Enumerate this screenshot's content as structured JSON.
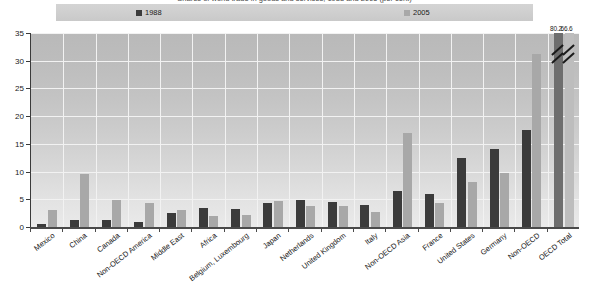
{
  "title": {
    "text": "Shares of world trade in goods and services, 1988 and 2005 (per cent)"
  },
  "legend": {
    "position": "top",
    "entries": [
      {
        "label": "1988",
        "color": "#3b3b3b"
      },
      {
        "label": "2005",
        "color": "#a8a8a8"
      }
    ]
  },
  "axes": {
    "y_ticks": [
      "0",
      "5",
      "10",
      "15",
      "20",
      "25",
      "30",
      "35"
    ],
    "x_label": "",
    "y_label": ""
  },
  "annotations": [
    {
      "text": "80.2",
      "series": "1988",
      "category": "OECD Total"
    },
    {
      "text": "66.6",
      "series": "2005",
      "category": "OECD Total"
    }
  ],
  "chart_data": {
    "type": "bar",
    "title": "Shares of world trade in goods and services, 1988 and 2005 (per cent)",
    "xlabel": "",
    "ylabel": "",
    "ylim": [
      0,
      35
    ],
    "yticks": [
      0,
      5,
      10,
      15,
      20,
      25,
      30,
      35
    ],
    "grid": true,
    "legend_position": "top",
    "note": "OECD Total bars exceed the axis maximum and are drawn truncated with break marks; their true values are 80.2 (1988) and 66.6 (2005).",
    "categories": [
      "Mexico",
      "China",
      "Canada",
      "Non-OECD America",
      "Middle East",
      "Africa",
      "Belgium, Luxembourg",
      "Japan",
      "Netherlands",
      "United Kingdom",
      "Italy",
      "Non-OECD Asia",
      "France",
      "United States",
      "Germany",
      "Non-OECD",
      "OECD Total"
    ],
    "series": [
      {
        "name": "1988",
        "color": "#3b3b3b",
        "values": [
          0.6,
          1.3,
          1.2,
          0.9,
          2.6,
          3.4,
          3.2,
          4.4,
          4.9,
          4.6,
          3.9,
          6.5,
          6.0,
          12.4,
          14.0,
          17.5,
          80.2
        ]
      },
      {
        "name": "2005",
        "color": "#a8a8a8",
        "values": [
          3.0,
          9.5,
          4.8,
          4.4,
          3.1,
          2.0,
          2.2,
          4.7,
          3.8,
          3.8,
          2.7,
          17.0,
          4.4,
          8.2,
          9.8,
          31.3,
          66.6
        ]
      }
    ]
  }
}
